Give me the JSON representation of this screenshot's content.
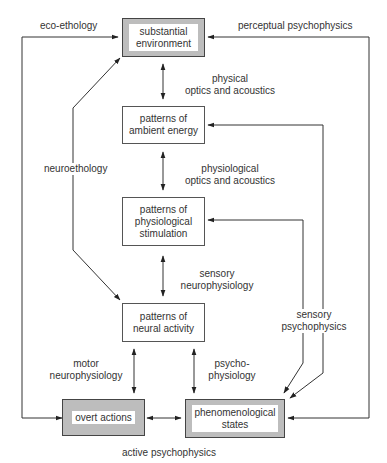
{
  "diagram": {
    "nodes": {
      "substantial_environment": {
        "label": "substantial\nenvironment",
        "style": "shaded"
      },
      "ambient_energy": {
        "label": "patterns of\nambient energy",
        "style": "plain"
      },
      "physiological_stimulation": {
        "label": "patterns of\nphysiological\nstimulation",
        "style": "plain"
      },
      "neural_activity": {
        "label": "patterns of\nneural activity",
        "style": "plain"
      },
      "overt_actions": {
        "label": "overt actions",
        "style": "shaded"
      },
      "phenomenological_states": {
        "label": "phenomenological\nstates",
        "style": "shaded"
      }
    },
    "edges": {
      "physical_optics": {
        "label": "physical\noptics and acoustics",
        "from": "substantial_environment",
        "to": "ambient_energy",
        "direction": "both"
      },
      "physiological_optics": {
        "label": "physiological\noptics and acoustics",
        "from": "ambient_energy",
        "to": "physiological_stimulation",
        "direction": "both"
      },
      "sensory_neurophysiology": {
        "label": "sensory\nneurophysiology",
        "from": "physiological_stimulation",
        "to": "neural_activity",
        "direction": "both"
      },
      "motor_neurophysiology": {
        "label": "motor\nneurophysiology",
        "from": "neural_activity",
        "to": "overt_actions",
        "direction": "both"
      },
      "psychophysiology": {
        "label": "psycho-\nphysiology",
        "from": "neural_activity",
        "to": "phenomenological_states",
        "direction": "both"
      },
      "active_psychophysics": {
        "label": "active psychophysics",
        "from": "overt_actions",
        "to": "phenomenological_states",
        "direction": "both"
      },
      "eco_ethology": {
        "label": "eco-ethology",
        "from": "overt_actions",
        "to": "substantial_environment",
        "direction": "forward"
      },
      "perceptual_psychophysics": {
        "label": "perceptual psychophysics",
        "from": "phenomenological_states",
        "to": "substantial_environment",
        "direction": "both"
      },
      "neuroethology": {
        "label": "neuroethology",
        "from": "substantial_environment",
        "to": "neural_activity",
        "direction": "both"
      },
      "sensory_psychophysics": {
        "label": "sensory\npsychophysics",
        "from": "phenomenological_states",
        "to": [
          "ambient_energy",
          "physiological_stimulation"
        ],
        "direction": "both"
      }
    },
    "colors": {
      "line": "#333333",
      "box_border": "#555555",
      "shaded_fill": "#bdbdbd",
      "text": "#333333"
    }
  }
}
